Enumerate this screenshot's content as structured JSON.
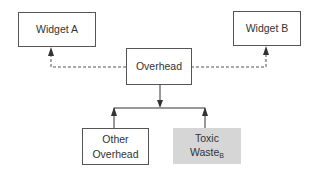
{
  "diagram": {
    "nodes": [
      {
        "id": "widget_a",
        "label": "Widget A"
      },
      {
        "id": "widget_b",
        "label": "Widget B"
      },
      {
        "id": "overhead",
        "label": "Overhead"
      },
      {
        "id": "other_overhead",
        "label_line1": "Other",
        "label_line2": "Overhead"
      },
      {
        "id": "toxic_waste",
        "label_line1": "Toxic",
        "label_line2": "Waste",
        "subscript": "B",
        "fill": "#d6d6d6"
      }
    ],
    "edges": [
      {
        "from": "overhead",
        "to": "widget_a",
        "style": "dashed"
      },
      {
        "from": "overhead",
        "to": "widget_b",
        "style": "dashed"
      },
      {
        "from": "overhead",
        "to": "other_overhead",
        "style": "solid"
      },
      {
        "from": "overhead",
        "to": "toxic_waste",
        "style": "solid"
      }
    ]
  }
}
